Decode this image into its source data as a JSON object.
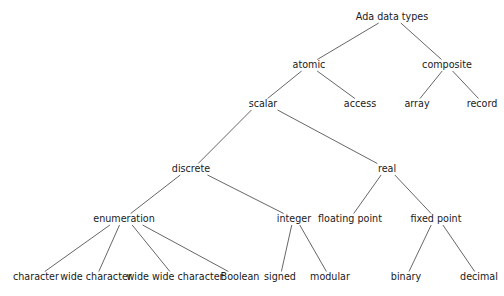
{
  "diagram": {
    "title": "Ada data types",
    "type": "tree-hierarchy",
    "background_color": "#ffffff",
    "edge_color": "#555555",
    "label_color": "#1a1a1a",
    "width": 504,
    "height": 296,
    "nodes": [
      {
        "id": "ada-data-types",
        "label": "Ada data types",
        "x": 392,
        "y": 20,
        "level": 0
      },
      {
        "id": "atomic",
        "label": "atomic",
        "x": 309,
        "y": 68,
        "level": 1
      },
      {
        "id": "composite",
        "label": "composite",
        "x": 447,
        "y": 68,
        "level": 1
      },
      {
        "id": "scalar",
        "label": "scalar",
        "x": 263,
        "y": 107,
        "level": 2
      },
      {
        "id": "access",
        "label": "access",
        "x": 360,
        "y": 107,
        "level": 2
      },
      {
        "id": "array",
        "label": "array",
        "x": 417,
        "y": 107,
        "level": 2
      },
      {
        "id": "record",
        "label": "record",
        "x": 482,
        "y": 107,
        "level": 2
      },
      {
        "id": "discrete",
        "label": "discrete",
        "x": 191,
        "y": 172,
        "level": 3
      },
      {
        "id": "real",
        "label": "real",
        "x": 387,
        "y": 172,
        "level": 3
      },
      {
        "id": "enumeration",
        "label": "enumeration",
        "x": 124,
        "y": 222,
        "level": 4
      },
      {
        "id": "integer",
        "label": "integer",
        "x": 294,
        "y": 222,
        "level": 4
      },
      {
        "id": "floating-point",
        "label": "floating point",
        "x": 350,
        "y": 222,
        "level": 4
      },
      {
        "id": "fixed-point",
        "label": "fixed point",
        "x": 436,
        "y": 222,
        "level": 4
      },
      {
        "id": "character",
        "label": "character",
        "x": 36,
        "y": 280,
        "level": 5
      },
      {
        "id": "wide-character",
        "label": "wide character",
        "x": 96,
        "y": 280,
        "level": 5
      },
      {
        "id": "wide-wide-character",
        "label": "wide wide character",
        "x": 175,
        "y": 280,
        "level": 5
      },
      {
        "id": "boolean",
        "label": "Boolean",
        "x": 240,
        "y": 280,
        "level": 5
      },
      {
        "id": "signed",
        "label": "signed",
        "x": 280,
        "y": 280,
        "level": 5
      },
      {
        "id": "modular",
        "label": "modular",
        "x": 330,
        "y": 280,
        "level": 5
      },
      {
        "id": "binary",
        "label": "binary",
        "x": 406,
        "y": 280,
        "level": 5
      },
      {
        "id": "decimal",
        "label": "decimal",
        "x": 479,
        "y": 280,
        "level": 5
      }
    ],
    "edges": [
      {
        "from": "ada-data-types",
        "to": "atomic"
      },
      {
        "from": "ada-data-types",
        "to": "composite"
      },
      {
        "from": "atomic",
        "to": "scalar"
      },
      {
        "from": "atomic",
        "to": "access"
      },
      {
        "from": "composite",
        "to": "array"
      },
      {
        "from": "composite",
        "to": "record"
      },
      {
        "from": "scalar",
        "to": "discrete"
      },
      {
        "from": "scalar",
        "to": "real"
      },
      {
        "from": "discrete",
        "to": "enumeration"
      },
      {
        "from": "discrete",
        "to": "integer"
      },
      {
        "from": "real",
        "to": "floating-point"
      },
      {
        "from": "real",
        "to": "fixed-point"
      },
      {
        "from": "enumeration",
        "to": "character"
      },
      {
        "from": "enumeration",
        "to": "wide-character"
      },
      {
        "from": "enumeration",
        "to": "wide-wide-character"
      },
      {
        "from": "enumeration",
        "to": "boolean"
      },
      {
        "from": "integer",
        "to": "signed"
      },
      {
        "from": "integer",
        "to": "modular"
      },
      {
        "from": "fixed-point",
        "to": "binary"
      },
      {
        "from": "fixed-point",
        "to": "decimal"
      }
    ]
  }
}
